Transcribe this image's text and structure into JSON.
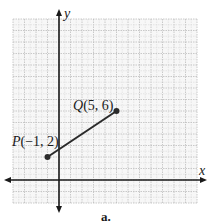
{
  "figure": {
    "caption": "a.",
    "axes": {
      "x_label": "x",
      "y_label": "y",
      "x_range": [
        -4,
        12
      ],
      "y_range": [
        -2,
        14
      ],
      "grid": true,
      "grid_minor_step": 0.5,
      "tick_labels": "none"
    },
    "points": [
      {
        "name": "P",
        "x": -1,
        "y": 2,
        "label": "P",
        "coords": "(−1, 2)"
      },
      {
        "name": "Q",
        "x": 5,
        "y": 6,
        "label": "Q",
        "coords": "(5, 6)"
      }
    ],
    "segment": {
      "from": "P",
      "to": "Q"
    },
    "colors": {
      "grid_minor": "#d8d8d8",
      "grid_major": "#bdbdbd",
      "axis": "#1a1a1a",
      "segment": "#2a2a2a",
      "point": "#2a2a2a"
    }
  }
}
